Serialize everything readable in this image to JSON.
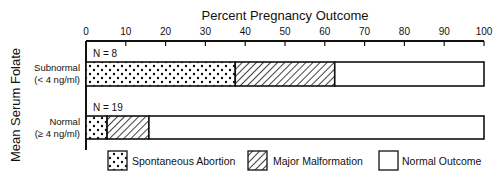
{
  "chart_data": {
    "type": "bar",
    "orientation": "horizontal",
    "stacked": true,
    "title": "Percent Pregnancy Outcome",
    "xlabel": "Percent Pregnancy Outcome",
    "ylabel": "Mean Serum Folate",
    "xlim": [
      0,
      100
    ],
    "xticks": [
      "0",
      "10",
      "20",
      "30",
      "40",
      "50",
      "60",
      "70",
      "80",
      "90",
      "100"
    ],
    "grid": false,
    "legend_position": "bottom",
    "categories": [
      {
        "line1": "Subnormal",
        "line2": "(< 4 ng/ml)",
        "n_label": "N = 8"
      },
      {
        "line1": "Normal",
        "line2": "(≥ 4 ng/ml)",
        "n_label": "N = 19"
      }
    ],
    "series": [
      {
        "name": "Spontaneous Abortion",
        "pattern": "dots",
        "values": [
          37.5,
          5.3
        ]
      },
      {
        "name": "Major Malformation",
        "pattern": "hatch",
        "values": [
          25.0,
          10.5
        ]
      },
      {
        "name": "Normal Outcome",
        "pattern": "blank",
        "values": [
          37.5,
          84.2
        ]
      }
    ]
  }
}
